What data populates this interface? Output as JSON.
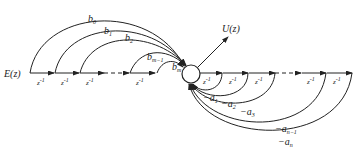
{
  "diagram": {
    "type": "signal-flow-graph",
    "input": {
      "label": "E(z)"
    },
    "output": {
      "label": "U(z)"
    },
    "summing_node": {
      "label": ""
    },
    "delay_label": "z",
    "delay_exp": "-1",
    "forward_chain": {
      "delays_visible": 5,
      "has_ellipsis": true
    },
    "feedback_chain": {
      "delays_visible": 5,
      "has_ellipsis": true
    },
    "feedforward_gains": [
      {
        "base": "b",
        "sub": "0"
      },
      {
        "base": "b",
        "sub": "1"
      },
      {
        "base": "b",
        "sub": "2"
      },
      {
        "base": "b",
        "sub": "m−1"
      },
      {
        "base": "b",
        "sub": "m"
      }
    ],
    "feedback_gains": [
      {
        "base": "−a",
        "sub": "1"
      },
      {
        "base": "−a",
        "sub": "2"
      },
      {
        "base": "−a",
        "sub": "3"
      },
      {
        "base": "−a",
        "sub": "n−1"
      },
      {
        "base": "−a",
        "sub": "n"
      }
    ],
    "line_color": "#222222"
  }
}
